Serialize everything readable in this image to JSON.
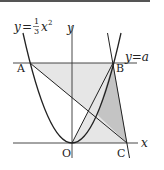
{
  "figure": {
    "parabola_label": {
      "lhs": "y",
      "eq": "=",
      "num": "1",
      "den": "3",
      "var": "x",
      "exp": "2"
    },
    "line_label": "y=a",
    "axis_labels": {
      "x": "x",
      "y": "y"
    },
    "points": {
      "A": "A",
      "B": "B",
      "O": "O",
      "C": "C"
    },
    "colors": {
      "stroke": "#222222",
      "fill_light": "#e6e6e6",
      "fill_dark": "#c8c8c8"
    }
  }
}
